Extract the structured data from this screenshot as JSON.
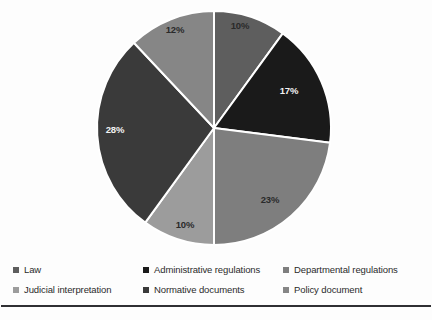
{
  "chart_data": {
    "type": "pie",
    "title": "",
    "subtitle": "",
    "xlabel": "",
    "ylabel": "",
    "grid": false,
    "legend_position": "bottom",
    "legend_columns": 3,
    "legend_rows": 2,
    "value_unit": "%",
    "start_angle_deg": 0,
    "direction": "clockwise",
    "categories": [
      "Law",
      "Administrative regulations",
      "Departmental regulations",
      "Judicial interpretation",
      "Normative documents",
      "Policy document"
    ],
    "values": [
      10,
      17,
      23,
      10,
      28,
      12
    ],
    "labels": [
      "10%",
      "17%",
      "23%",
      "10%",
      "28%",
      "12%"
    ],
    "colors": [
      "#5e5e5e",
      "#1a1a1a",
      "#7e7e7e",
      "#9c9c9c",
      "#3a3a3a",
      "#868686"
    ],
    "label_colors": [
      "#2a2a2a",
      "#f2f2f2",
      "#2a2a2a",
      "#2a2a2a",
      "#f2f2f2",
      "#2a2a2a"
    ],
    "slices": [
      {
        "name": "Law",
        "value": 10,
        "label": "10%",
        "color": "#5e5e5e",
        "label_color": "#2a2a2a",
        "start_deg": 0,
        "end_deg": 36,
        "label_x": 240,
        "label_y": 29
      },
      {
        "name": "Administrative regulations",
        "value": 17,
        "label": "17%",
        "color": "#1a1a1a",
        "label_color": "#f2f2f2",
        "start_deg": 36,
        "end_deg": 97.2,
        "label_x": 289,
        "label_y": 94
      },
      {
        "name": "Departmental regulations",
        "value": 23,
        "label": "23%",
        "color": "#7e7e7e",
        "label_color": "#2a2a2a",
        "start_deg": 97.2,
        "end_deg": 180,
        "label_x": 270,
        "label_y": 203
      },
      {
        "name": "Judicial interpretation",
        "value": 10,
        "label": "10%",
        "color": "#9c9c9c",
        "label_color": "#2a2a2a",
        "start_deg": 180,
        "end_deg": 216,
        "label_x": 185,
        "label_y": 228
      },
      {
        "name": "Normative documents",
        "value": 28,
        "label": "28%",
        "color": "#3a3a3a",
        "label_color": "#f2f2f2",
        "start_deg": 216,
        "end_deg": 316.8,
        "label_x": 115,
        "label_y": 133
      },
      {
        "name": "Policy document",
        "value": 12,
        "label": "12%",
        "color": "#868686",
        "label_color": "#2a2a2a",
        "start_deg": 316.8,
        "end_deg": 360,
        "label_x": 175,
        "label_y": 33
      }
    ],
    "geometry": {
      "center_x": 214,
      "center_y": 128,
      "radius": 117,
      "separator_color": "#ffffff",
      "separator_width": 2
    }
  },
  "legend": {
    "entries": [
      {
        "label": "Law",
        "color": "#5e5e5e",
        "row": 0,
        "col": 0
      },
      {
        "label": "Administrative regulations",
        "color": "#1a1a1a",
        "row": 0,
        "col": 1
      },
      {
        "label": "Departmental regulations",
        "color": "#7e7e7e",
        "row": 0,
        "col": 2
      },
      {
        "label": "Judicial interpretation",
        "color": "#9c9c9c",
        "row": 1,
        "col": 0
      },
      {
        "label": "Normative documents",
        "color": "#3a3a3a",
        "row": 1,
        "col": 1
      },
      {
        "label": "Policy document",
        "color": "#868686",
        "row": 1,
        "col": 2
      }
    ]
  },
  "divider": {
    "color": "#2f2f33"
  }
}
